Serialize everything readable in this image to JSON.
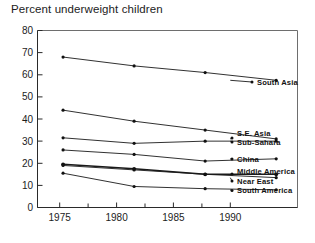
{
  "chart_data": {
    "type": "line",
    "title": "Percent underweight children",
    "xlabel": "",
    "ylabel": "",
    "x": [
      1975,
      1980,
      1985,
      1990
    ],
    "xtick_labels": [
      "1975",
      "1980",
      "1985",
      "1990"
    ],
    "ytick_labels": [
      "0",
      "10",
      "20",
      "30",
      "40",
      "50",
      "60",
      "70",
      "80"
    ],
    "ytick_values": [
      0,
      10,
      20,
      30,
      40,
      50,
      60,
      70,
      80
    ],
    "xlim": [
      1973.2,
      1991.5
    ],
    "ylim": [
      0,
      80
    ],
    "grid": false,
    "legend_position": "right-inline",
    "minor_x_ticks": true,
    "series": [
      {
        "name": "South Asia",
        "label": "South Asia",
        "values": [
          68,
          64,
          61,
          57.5
        ],
        "emphasis": false
      },
      {
        "name": "S.E. Asia",
        "label": "S.E. Asia",
        "values": [
          44,
          39,
          35,
          31
        ],
        "emphasis": false
      },
      {
        "name": "Sub-Sahara",
        "label": "Sub-Sahara",
        "values": [
          31.5,
          29,
          30,
          30
        ],
        "emphasis": false
      },
      {
        "name": "China",
        "label": "China",
        "values": [
          26,
          24,
          21,
          22
        ],
        "emphasis": false
      },
      {
        "name": "Middle America",
        "label": "Middle America",
        "values": [
          19.5,
          17.5,
          15,
          15
        ],
        "emphasis": true
      },
      {
        "name": "Near East",
        "label": "Near East",
        "values": [
          19,
          17,
          15,
          13.5
        ],
        "emphasis": false
      },
      {
        "name": "South America",
        "label": "South America",
        "values": [
          15.5,
          9.5,
          8.5,
          8
        ],
        "emphasis": false
      }
    ]
  },
  "labels": {
    "south_asia": "South Asia",
    "se_asia": "S.E. Asia",
    "sub_sahara": "Sub-Sahara",
    "china": "China",
    "middle_america": "Middle America",
    "near_east": "Near East",
    "south_america": "South America"
  },
  "axis": {
    "y_0": "0",
    "y_10": "10",
    "y_20": "20",
    "y_30": "30",
    "y_40": "40",
    "y_50": "50",
    "y_60": "60",
    "y_70": "70",
    "y_80": "80",
    "x_1975": "1975",
    "x_1980": "1980",
    "x_1985": "1985",
    "x_1990": "1990"
  },
  "colors": {
    "line": "#1a1a1a",
    "frame": "#6e6e6e",
    "text": "#1c1c1c",
    "background": "#ffffff"
  }
}
